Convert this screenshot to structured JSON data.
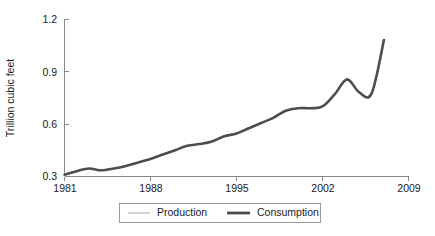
{
  "chart_data": {
    "type": "line",
    "title": "",
    "xlabel": "",
    "ylabel": "Trillion cubic feet",
    "xlim": [
      1981,
      2009
    ],
    "ylim": [
      0.3,
      1.2
    ],
    "grid": false,
    "legend_position": "bottom",
    "x_ticks": [
      "1981",
      "1988",
      "1995",
      "2002",
      "2009"
    ],
    "x_tick_values": [
      1981,
      1988,
      1995,
      2002,
      2009
    ],
    "y_ticks": [
      "0.3",
      "0.6",
      "0.9",
      "1.2"
    ],
    "y_tick_values": [
      0.3,
      0.6,
      0.9,
      1.2
    ],
    "x": [
      1981,
      1982,
      1983,
      1984,
      1985,
      1986,
      1987,
      1988,
      1989,
      1990,
      1991,
      1992,
      1993,
      1994,
      1995,
      1996,
      1997,
      1998,
      1999,
      2000,
      2001,
      2002,
      2003,
      2004,
      2005,
      2006,
      2007
    ],
    "series": [
      {
        "name": "Production",
        "color": "#d4d4d4",
        "values": [
          null,
          null,
          null,
          null,
          null,
          null,
          null,
          null,
          null,
          null,
          null,
          null,
          null,
          null,
          null,
          null,
          null,
          null,
          null,
          null,
          null,
          null,
          null,
          null,
          null,
          null,
          null
        ]
      },
      {
        "name": "Consumption",
        "color": "#4d4d4d",
        "values": [
          0.31,
          0.33,
          0.345,
          0.335,
          0.345,
          0.36,
          0.38,
          0.4,
          0.425,
          0.45,
          0.475,
          0.485,
          0.5,
          0.53,
          0.545,
          0.575,
          0.605,
          0.635,
          0.675,
          0.69,
          0.69,
          0.7,
          0.77,
          0.855,
          0.78,
          0.775,
          1.08
        ],
        "annotations": [
          {
            "label": "local bump",
            "x": 1983,
            "y": 0.345
          },
          {
            "label": "peak before dip",
            "x": 2000,
            "y": 0.855
          },
          {
            "label": "dip",
            "x": 2001,
            "y": 0.77
          },
          {
            "label": "maximum",
            "x": 2006,
            "y": 1.11
          },
          {
            "label": "final value",
            "x": 2007,
            "y": 1.08
          }
        ]
      }
    ]
  },
  "legend": {
    "items": [
      {
        "label": "Production",
        "swatch": "light-gray-line"
      },
      {
        "label": "Consumption",
        "swatch": "dark-gray-line"
      }
    ]
  },
  "axes": {
    "y_title": "Trillion cubic feet"
  }
}
